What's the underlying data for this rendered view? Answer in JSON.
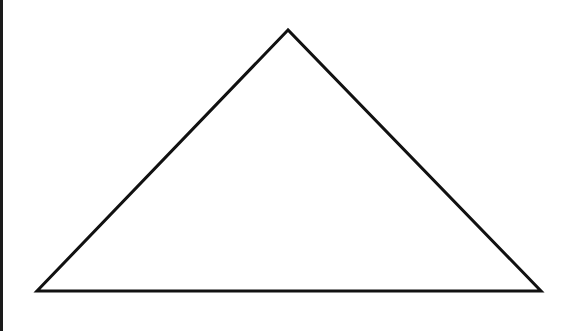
{
  "diagram": {
    "type": "triangle",
    "shape": "isosceles-triangle",
    "stroke_color": "#111111",
    "fill_color": "#ffffff",
    "stroke_width": 3,
    "vertices": {
      "apex": {
        "x": 288,
        "y": 30
      },
      "bottom_left": {
        "x": 37,
        "y": 291
      },
      "bottom_right": {
        "x": 541,
        "y": 291
      }
    },
    "points": "288,30 37,291 541,291"
  },
  "frame": {
    "left_border_color": "#1a1a1a",
    "background": "#ffffff"
  }
}
